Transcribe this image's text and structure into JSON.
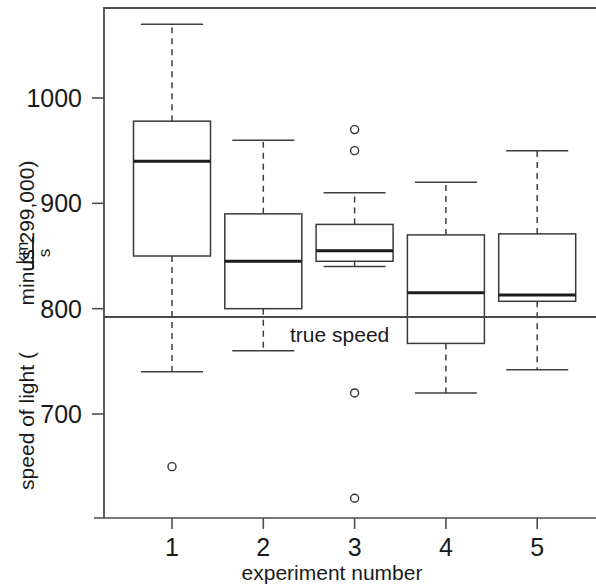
{
  "chart_data": {
    "type": "box",
    "title": "",
    "subtitle": "",
    "xlabel": "experiment number",
    "ylabel_parts": {
      "prefix": "speed of light (",
      "frac_numerator": "km",
      "frac_denominator": "s",
      "suffix": " minus 299,000)"
    },
    "ylabel": "speed of light ( km / s  minus 299,000)",
    "categories": [
      "1",
      "2",
      "3",
      "4",
      "5"
    ],
    "xticklabels": [
      "1",
      "2",
      "3",
      "4",
      "5"
    ],
    "yticklabels": [
      "1000",
      "900",
      "800",
      "700"
    ],
    "ytickvalues": [
      1000,
      900,
      800,
      700
    ],
    "ylim": [
      608,
      1090
    ],
    "xlim": [
      0.5,
      5.5
    ],
    "grid": false,
    "legend": null,
    "annotations": [
      {
        "label": "true speed",
        "type": "hline",
        "value": 792,
        "text_x": 2.95,
        "text_y": 775
      }
    ],
    "boxes": [
      {
        "name": "1",
        "category": "1",
        "q1": 850,
        "median": 940,
        "q3": 978,
        "whisker_low": 740,
        "whisker_high": 1070,
        "outliers": [
          650
        ]
      },
      {
        "name": "2",
        "category": "2",
        "q1": 800,
        "median": 845,
        "q3": 890,
        "whisker_low": 760,
        "whisker_high": 960,
        "outliers": []
      },
      {
        "name": "3",
        "category": "3",
        "q1": 845,
        "median": 855,
        "q3": 880,
        "whisker_low": 840,
        "whisker_high": 910,
        "outliers": [
          970,
          950,
          720,
          620
        ]
      },
      {
        "name": "4",
        "category": "4",
        "q1": 767,
        "median": 815,
        "q3": 870,
        "whisker_low": 720,
        "whisker_high": 920,
        "outliers": []
      },
      {
        "name": "5",
        "category": "5",
        "q1": 807,
        "median": 813,
        "q3": 871,
        "whisker_low": 742,
        "whisker_high": 950,
        "outliers": []
      }
    ],
    "colors": {
      "box_fill": "#ffffff",
      "box_edge": "#3a3a3a",
      "median": "#1c1c1c",
      "whisker": "#3f3f3f",
      "axis": "#4d4d4d",
      "text": "#1a1a1a",
      "true_speed_line": "#4a4a4a",
      "background": "#ffffff"
    }
  }
}
